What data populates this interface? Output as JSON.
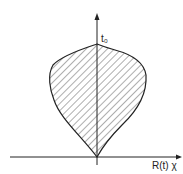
{
  "diagram": {
    "y_axis_label": "t₀",
    "x_axis_label": "R(t) χ",
    "region": "hatched region bounded by closed curve from origin to t0",
    "colors": {
      "stroke": "#222222",
      "hatch": "#333333",
      "background": "#ffffff"
    }
  }
}
